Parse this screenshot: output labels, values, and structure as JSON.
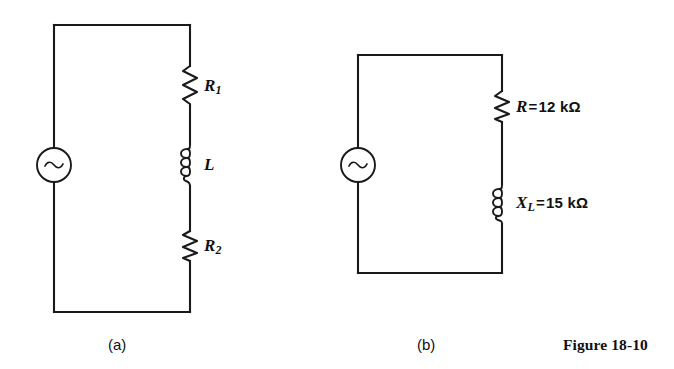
{
  "figure": {
    "caption": "Figure 18-10",
    "background_color": "#ffffff",
    "ink_color": "#1a1a1a"
  },
  "panels": [
    {
      "id": "a",
      "caption": "(a)",
      "source": {
        "type": "ac-voltage-source",
        "symbol": "~"
      },
      "components": [
        {
          "id": "R1",
          "type": "resistor",
          "symbol": "R",
          "subscript": "1",
          "label": "R₁",
          "value": "",
          "unit": ""
        },
        {
          "id": "L",
          "type": "inductor",
          "symbol": "L",
          "subscript": "",
          "label": "L",
          "value": "",
          "unit": ""
        },
        {
          "id": "R2",
          "type": "resistor",
          "symbol": "R",
          "subscript": "2",
          "label": "R₂",
          "value": "",
          "unit": ""
        }
      ]
    },
    {
      "id": "b",
      "caption": "(b)",
      "source": {
        "type": "ac-voltage-source",
        "symbol": "~"
      },
      "components": [
        {
          "id": "R",
          "type": "resistor",
          "symbol": "R",
          "subscript": "",
          "label": "R = 12 kΩ",
          "equals": "=",
          "value": "12",
          "unit": "kΩ"
        },
        {
          "id": "XL",
          "type": "inductor",
          "symbol": "X",
          "subscript": "L",
          "label": "Xₗ = 15 kΩ",
          "equals": "=",
          "value": "15",
          "unit": "kΩ"
        }
      ]
    }
  ]
}
